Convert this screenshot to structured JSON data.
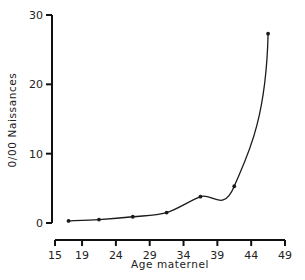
{
  "chart_data": {
    "type": "line",
    "title": "",
    "xlabel": "Age maternel",
    "ylabel": "0/00 Naissances",
    "x_ticks": [
      15,
      19,
      24,
      29,
      34,
      39,
      44,
      49
    ],
    "y_ticks": [
      0,
      10,
      20,
      30
    ],
    "xlim": [
      15,
      49
    ],
    "ylim": [
      0,
      30
    ],
    "grid": false,
    "legend": null,
    "series": [
      {
        "name": "Taux pour 1000 naissances",
        "x": [
          17,
          21.5,
          26.5,
          31.5,
          36.5,
          41.5,
          46.5
        ],
        "values": [
          0.3,
          0.5,
          0.9,
          1.5,
          3.8,
          5.3,
          27.3
        ],
        "marker": "dot",
        "smooth": true
      }
    ],
    "colors": {
      "line": "#1a1a1a",
      "axis": "#111111",
      "text": "#222222"
    }
  }
}
